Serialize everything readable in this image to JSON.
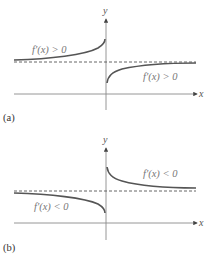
{
  "panels": [
    {
      "id": "a",
      "caption": "(a)",
      "x_axis_label": "x",
      "y_axis_label": "y",
      "left_branch_label": "f′(x) > 0",
      "right_branch_label": "f′(x) > 0",
      "description": "Left branch increases toward vertical asymptote from below-ish horizontal asymptote; right branch increases from near axis up toward horizontal asymptote"
    },
    {
      "id": "b",
      "caption": "(b)",
      "x_axis_label": "x",
      "y_axis_label": "y",
      "left_branch_label": "f′(x) < 0",
      "right_branch_label": "f′(x) < 0",
      "description": "Left branch decreases from horizontal asymptote toward vertical asymptote; right branch decreases from high value down toward horizontal asymptote"
    }
  ],
  "colors": {
    "curve": "#555555",
    "axis": "#888888",
    "asymptote": "#555555",
    "label": "#777777"
  }
}
